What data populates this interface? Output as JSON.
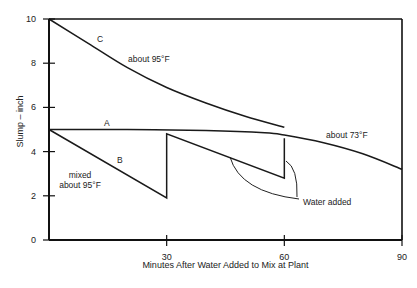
{
  "chart_data": {
    "type": "line",
    "title": "",
    "xlabel": "Minutes After Water Added to Mix at Plant",
    "ylabel": "Slump – inch",
    "xlim": [
      0,
      90
    ],
    "ylim": [
      0,
      10
    ],
    "x_ticks": [
      30,
      60,
      90
    ],
    "y_ticks": [
      0,
      2,
      4,
      6,
      8,
      10
    ],
    "grid": false,
    "legend": null,
    "series": [
      {
        "name": "A",
        "annotation": "about 73°F",
        "x": [
          0,
          20,
          40,
          55,
          60,
          70,
          80,
          90
        ],
        "y": [
          5.0,
          5.0,
          4.95,
          4.85,
          4.75,
          4.4,
          3.9,
          3.2
        ]
      },
      {
        "name": "B",
        "annotation": "mixed about 95°F",
        "x": [
          0,
          30,
          30,
          60,
          60
        ],
        "y": [
          5.0,
          1.9,
          4.8,
          2.8,
          4.6
        ]
      },
      {
        "name": "C",
        "annotation": "about 95°F",
        "x": [
          0,
          10,
          20,
          30,
          40,
          50,
          60
        ],
        "y": [
          10.0,
          8.9,
          7.8,
          6.9,
          6.2,
          5.6,
          5.1
        ]
      }
    ],
    "annotations": [
      {
        "text": "Water added",
        "points_to": [
          [
            30,
            4.8
          ],
          [
            60,
            4.6
          ]
        ]
      }
    ]
  }
}
